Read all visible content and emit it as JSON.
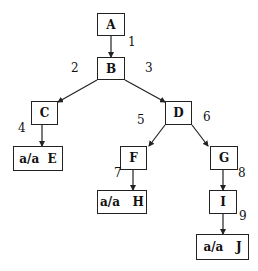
{
  "nodes": [
    {
      "id": "A",
      "label": "A",
      "x": 97,
      "y": 13,
      "w": 28,
      "h": 23
    },
    {
      "id": "B",
      "label": "B",
      "x": 97,
      "y": 57,
      "w": 28,
      "h": 23
    },
    {
      "id": "C",
      "label": "C",
      "x": 31,
      "y": 101,
      "w": 27,
      "h": 24
    },
    {
      "id": "D",
      "label": "D",
      "x": 165,
      "y": 101,
      "w": 27,
      "h": 24
    },
    {
      "id": "E",
      "label": "a/a  E",
      "x": 13,
      "y": 146,
      "w": 50,
      "h": 25
    },
    {
      "id": "F",
      "label": "F",
      "x": 120,
      "y": 146,
      "w": 27,
      "h": 24
    },
    {
      "id": "G",
      "label": "G",
      "x": 210,
      "y": 146,
      "w": 28,
      "h": 24
    },
    {
      "id": "H",
      "label": "a/a   H",
      "x": 97,
      "y": 190,
      "w": 50,
      "h": 24
    },
    {
      "id": "I",
      "label": "I",
      "x": 209,
      "y": 190,
      "w": 28,
      "h": 24
    },
    {
      "id": "J",
      "label": "a/a   J",
      "x": 196,
      "y": 234,
      "w": 53,
      "h": 26
    }
  ],
  "edges": [
    {
      "from": "A",
      "to": "B",
      "label": "1",
      "x1": 111,
      "y1": 36,
      "x2": 111,
      "y2": 57,
      "lx": 128,
      "ly": 41
    },
    {
      "from": "B",
      "to": "C",
      "label": "2",
      "x1": 97,
      "y1": 80,
      "x2": 58,
      "y2": 102,
      "lx": 71,
      "ly": 67
    },
    {
      "from": "B",
      "to": "D",
      "label": "3",
      "x1": 125,
      "y1": 80,
      "x2": 165,
      "y2": 102,
      "lx": 145,
      "ly": 67
    },
    {
      "from": "C",
      "to": "E",
      "label": "4",
      "x1": 42,
      "y1": 125,
      "x2": 42,
      "y2": 146,
      "lx": 18,
      "ly": 127
    },
    {
      "from": "D",
      "to": "F",
      "label": "5",
      "x1": 165,
      "y1": 125,
      "x2": 149,
      "y2": 146,
      "lx": 137,
      "ly": 119
    },
    {
      "from": "D",
      "to": "G",
      "label": "6",
      "x1": 192,
      "y1": 125,
      "x2": 208,
      "y2": 146,
      "lx": 203,
      "ly": 116
    },
    {
      "from": "F",
      "to": "H",
      "label": "7",
      "x1": 133,
      "y1": 170,
      "x2": 133,
      "y2": 190,
      "lx": 114,
      "ly": 172
    },
    {
      "from": "G",
      "to": "I",
      "label": "8",
      "x1": 223,
      "y1": 170,
      "x2": 223,
      "y2": 190,
      "lx": 238,
      "ly": 172
    },
    {
      "from": "I",
      "to": "J",
      "label": "9",
      "x1": 223,
      "y1": 214,
      "x2": 223,
      "y2": 234,
      "lx": 239,
      "ly": 215
    }
  ]
}
